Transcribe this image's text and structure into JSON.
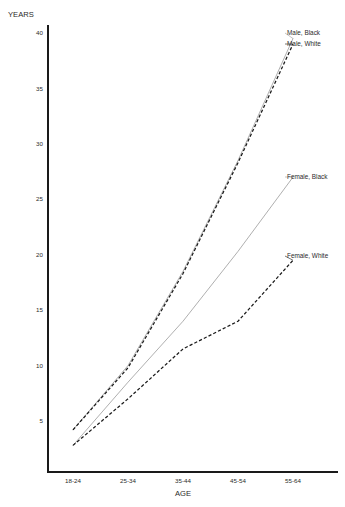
{
  "chart_data": {
    "type": "line",
    "title": "",
    "xlabel": "AGE",
    "ylabel": "YEARS",
    "categories": [
      "18-24",
      "25-34",
      "35-44",
      "45-54",
      "55-64"
    ],
    "ylim": [
      0,
      41
    ],
    "yticks": [
      5,
      10,
      15,
      20,
      25,
      30,
      35,
      40
    ],
    "ytick_labels": [
      "5",
      "10",
      "15",
      "20",
      "25",
      "30",
      "35",
      "40"
    ],
    "grid": false,
    "legend_position": "right-inline-labels",
    "series": [
      {
        "name": "Male, Black",
        "style": "solid",
        "color": "#9a9a9a",
        "values": [
          4.2,
          10.0,
          18.5,
          28.5,
          39.5
        ]
      },
      {
        "name": "Male, White",
        "style": "dashed",
        "color": "#1a1a1a",
        "values": [
          4.2,
          9.8,
          18.3,
          28.3,
          39.0
        ]
      },
      {
        "name": "Female, Black",
        "style": "solid",
        "color": "#9a9a9a",
        "values": [
          2.8,
          8.5,
          14.0,
          20.3,
          27.0
        ]
      },
      {
        "name": "Female, White",
        "style": "dashed",
        "color": "#1a1a1a",
        "values": [
          2.8,
          7.0,
          11.5,
          14.0,
          19.5
        ]
      }
    ],
    "annotations": [
      {
        "text": "Male, Black",
        "x": 287,
        "y": 35
      },
      {
        "text": "Male, White",
        "x": 287,
        "y": 46
      },
      {
        "text": "Female, Black",
        "x": 287,
        "y": 179
      },
      {
        "text": "Female, White",
        "x": 287,
        "y": 258
      }
    ]
  },
  "axes": {
    "y_title": "YEARS",
    "x_title": "AGE"
  }
}
